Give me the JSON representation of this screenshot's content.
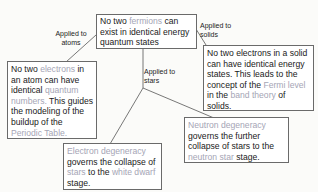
{
  "diagram": {
    "root": {
      "parts": [
        {
          "t": "No two ",
          "h": false
        },
        {
          "t": "fermions",
          "h": true
        },
        {
          "t": " can exist in identical energy quantum states",
          "h": false
        }
      ]
    },
    "edges": {
      "atoms": "Applied to atoms",
      "solids": "Applied to solids",
      "stars": "Applied to stars"
    },
    "atoms_box": {
      "parts": [
        {
          "t": "No two ",
          "h": false
        },
        {
          "t": "electrons",
          "h": true
        },
        {
          "t": " in an atom can have identical ",
          "h": false
        },
        {
          "t": "quantum numbers.",
          "h": true
        },
        {
          "t": " This guides the modeling of the buildup of the ",
          "h": false
        },
        {
          "t": "Periodic Table.",
          "h": true
        }
      ]
    },
    "solids_box": {
      "parts": [
        {
          "t": "No two electrons in a solid can have identical energy states. This leads to the concept of the ",
          "h": false
        },
        {
          "t": "Fermi level",
          "h": true
        },
        {
          "t": " in the ",
          "h": false
        },
        {
          "t": "band theory",
          "h": true
        },
        {
          "t": " of solids.",
          "h": false
        }
      ]
    },
    "white_dwarf_box": {
      "parts": [
        {
          "t": "Electron degeneracy",
          "h": true
        },
        {
          "t": " governs the collapse of ",
          "h": false
        },
        {
          "t": "stars",
          "h": true
        },
        {
          "t": " to the ",
          "h": false
        },
        {
          "t": "white dwarf",
          "h": true
        },
        {
          "t": " stage.",
          "h": false
        }
      ]
    },
    "neutron_star_box": {
      "parts": [
        {
          "t": "Neutron degeneracy",
          "h": true
        },
        {
          "t": " governs the further collapse of stars to the ",
          "h": false
        },
        {
          "t": "neutron star",
          "h": true
        },
        {
          "t": " stage.",
          "h": false
        }
      ]
    },
    "colors": {
      "highlight": "#a5a5b5",
      "text": "#1a1a1a",
      "border": "#6a6a6a",
      "line": "#555555"
    }
  }
}
